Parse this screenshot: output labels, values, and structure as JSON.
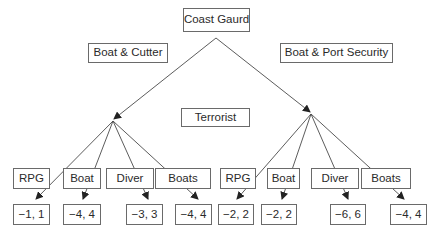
{
  "diagram": {
    "type": "game-tree",
    "root": {
      "label": "Coast Gaurd"
    },
    "defender_moves": [
      {
        "label": "Boat & Cutter"
      },
      {
        "label": "Boat & Port Security"
      }
    ],
    "attacker_player": {
      "label": "Terrorist"
    },
    "left_subtree": {
      "strategies": [
        {
          "label": "RPG",
          "payoff": "−1, 1"
        },
        {
          "label": "Boat",
          "payoff": "−4, 4"
        },
        {
          "label": "Diver",
          "payoff": "−3, 3"
        },
        {
          "label": "Boats",
          "payoff": "−4, 4"
        }
      ]
    },
    "right_subtree": {
      "strategies": [
        {
          "label": "RPG",
          "payoff": "−2, 2"
        },
        {
          "label": "Boat",
          "payoff": "−2, 2"
        },
        {
          "label": "Diver",
          "payoff": "−6, 6"
        },
        {
          "label": "Boats",
          "payoff": "−4, 4"
        }
      ]
    },
    "colors": {
      "line": "#4a4a4a",
      "box_border": "#6a6a6a",
      "text": "#2a2a2a"
    }
  }
}
